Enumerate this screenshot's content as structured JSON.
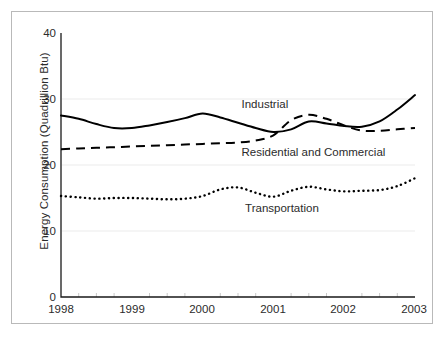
{
  "chart_data": {
    "type": "line",
    "title": "",
    "xlabel": "",
    "ylabel": "Energy Consumption (Quadrillion Btu)",
    "xlim": [
      1998,
      2003
    ],
    "ylim": [
      0,
      40
    ],
    "yticks": [
      "0",
      "10",
      "20",
      "30",
      "40"
    ],
    "ytick_values": [
      0,
      10,
      20,
      30,
      40
    ],
    "xticks": [
      "1998",
      "1999",
      "2000",
      "2001",
      "2002",
      "2003"
    ],
    "xtick_values": [
      1998,
      1999,
      2000,
      2001,
      2002,
      2003
    ],
    "grid": "horizontal-faint",
    "legend_position": "inline-annotations",
    "minor_ticks_per_year": 4,
    "series": [
      {
        "name": "Industrial",
        "style": "solid",
        "color": "#000000",
        "label_x": 2000.55,
        "label_y": 29.1,
        "x": [
          1998.0,
          1998.25,
          1998.5,
          1998.75,
          1999.0,
          1999.25,
          1999.5,
          1999.75,
          2000.0,
          2000.25,
          2000.5,
          2000.75,
          2001.0,
          2001.25,
          2001.5,
          2001.75,
          2002.0,
          2002.25,
          2002.5,
          2002.75,
          2003.0
        ],
        "values": [
          27.5,
          27.0,
          26.2,
          25.6,
          25.6,
          26.0,
          26.5,
          27.1,
          27.8,
          27.2,
          26.4,
          25.6,
          25.0,
          25.4,
          26.6,
          26.3,
          25.9,
          25.8,
          26.6,
          28.4,
          30.6
        ]
      },
      {
        "name": "Residential and Commercial",
        "style": "dashed",
        "color": "#000000",
        "label_x": 2000.55,
        "label_y": 21.8,
        "x": [
          1998.0,
          1998.25,
          1998.5,
          1998.75,
          1999.0,
          1999.25,
          1999.5,
          1999.75,
          2000.0,
          2000.25,
          2000.5,
          2000.75,
          2001.0,
          2001.25,
          2001.5,
          2001.75,
          2002.0,
          2002.25,
          2002.5,
          2002.75,
          2003.0
        ],
        "values": [
          22.4,
          22.5,
          22.6,
          22.7,
          22.8,
          22.9,
          23.0,
          23.1,
          23.2,
          23.3,
          23.4,
          23.7,
          24.5,
          26.8,
          27.6,
          27.0,
          26.0,
          25.2,
          25.2,
          25.4,
          25.6
        ]
      },
      {
        "name": "Transportation",
        "style": "dotted",
        "color": "#000000",
        "label_x": 2000.6,
        "label_y": 13.3,
        "x": [
          1998.0,
          1998.25,
          1998.5,
          1998.75,
          1999.0,
          1999.25,
          1999.5,
          1999.75,
          2000.0,
          2000.25,
          2000.5,
          2000.75,
          2001.0,
          2001.25,
          2001.5,
          2001.75,
          2002.0,
          2002.25,
          2002.5,
          2002.75,
          2003.0
        ],
        "values": [
          15.3,
          15.1,
          14.9,
          15.0,
          15.0,
          14.9,
          14.8,
          14.9,
          15.3,
          16.3,
          16.6,
          15.8,
          15.2,
          16.1,
          16.7,
          16.3,
          16.0,
          16.1,
          16.2,
          16.8,
          18.0
        ]
      }
    ]
  },
  "style_tokens": {
    "axis_color": "#1a1a1a",
    "frame_color": "#b9b9b9",
    "grid_color": "#f2f2f2",
    "text_color": "#2b2b2b",
    "background": "#ffffff"
  }
}
